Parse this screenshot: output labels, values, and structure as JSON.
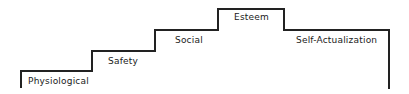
{
  "diagram": {
    "title": "",
    "line_color": "#222222",
    "steps": [
      {
        "label": "Physiological"
      },
      {
        "label": "Safety"
      },
      {
        "label": "Social"
      },
      {
        "label": "Esteem"
      },
      {
        "label": "Self-Actualization"
      }
    ]
  }
}
